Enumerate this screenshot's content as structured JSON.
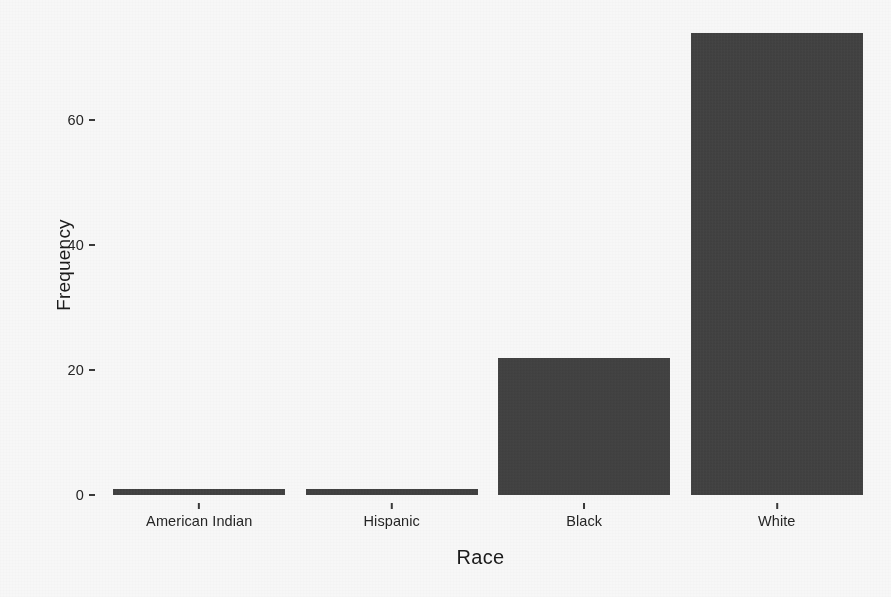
{
  "chart_data": {
    "type": "bar",
    "title": "",
    "subtitle": "",
    "xlabel": "Race",
    "ylabel": "Frequency",
    "categories": [
      "American Indian",
      "Hispanic",
      "Black",
      "White"
    ],
    "values": [
      1,
      1,
      22,
      74
    ],
    "ylim": [
      0,
      77
    ],
    "yticks": [
      0,
      20,
      40,
      60
    ],
    "ytick_labels": [
      "0",
      "20",
      "40",
      "60"
    ],
    "grid": false,
    "legend": false,
    "legend_position": "none",
    "bar_color": "#3a3a3a",
    "background_color": "#fdfdfd",
    "axis_color": "#3b3b3b",
    "bars": [
      {
        "category": "American Indian",
        "value": 1
      },
      {
        "category": "Hispanic",
        "value": 1
      },
      {
        "category": "Black",
        "value": 22
      },
      {
        "category": "White",
        "value": 74
      }
    ]
  }
}
